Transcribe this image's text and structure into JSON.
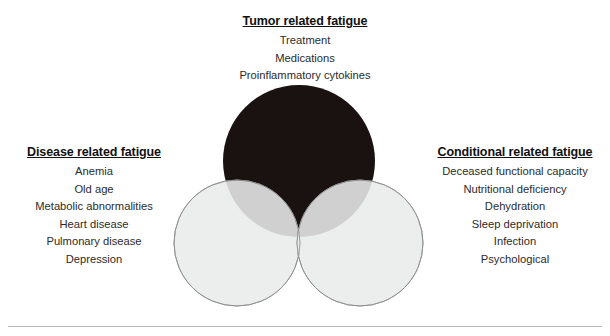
{
  "figure": {
    "type": "venn-diagram",
    "background_color": "#ffffff",
    "divider_color": "#b9b9b9",
    "sets": [
      {
        "id": "tumor",
        "title": "Tumor related fatigue",
        "position": "top",
        "fill_color": "#1a1210",
        "items": [
          "Treatment",
          "Medications",
          "Proinflammatory cytokines"
        ]
      },
      {
        "id": "disease",
        "title": "Disease related fatigue",
        "position": "bottom-left",
        "fill_color": "#e8e9ea",
        "stroke_color": "#9a9a9a",
        "items": [
          "Anemia",
          "Old age",
          "Metabolic abnormalities",
          "Heart disease",
          "Pulmonary disease",
          "Depression"
        ]
      },
      {
        "id": "conditional",
        "title": "Conditional related fatigue",
        "position": "bottom-right",
        "fill_color": "#e8e9ea",
        "stroke_color": "#9a9a9a",
        "items": [
          "Deceased functional capacity",
          "Nutritional deficiency",
          "Dehydration",
          "Sleep deprivation",
          "Infection",
          "Psychological"
        ]
      }
    ],
    "overlap_colors": {
      "tumor_disease": "#6e6e6e",
      "tumor_conditional": "#6e6e6e",
      "disease_conditional": "#f0f1f2",
      "triple": "#d2d4d5"
    }
  }
}
